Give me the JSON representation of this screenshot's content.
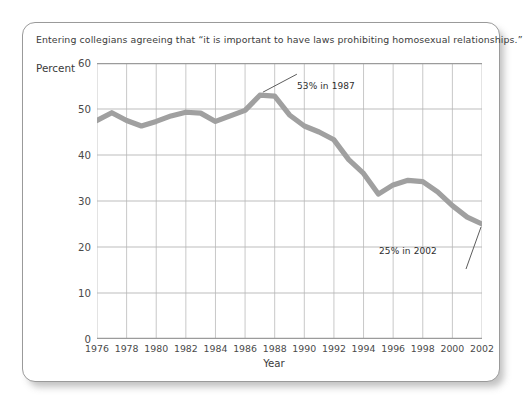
{
  "figure": {
    "title": "Entering collegians agreeing that “it is important to have laws prohibiting homosexual relationships.”",
    "percent_label": "Percent",
    "year_label": "Year"
  },
  "chart_data": {
    "type": "line",
    "title": "Entering collegians agreeing that “it is important to have laws prohibiting homosexual relationships.”",
    "xlabel": "Year",
    "ylabel": "Percent",
    "xlim": [
      1976,
      2002
    ],
    "ylim": [
      0,
      60
    ],
    "grid": true,
    "legend": "none",
    "line_color": "#a0a0a0",
    "x_tick_labels": [
      "1976",
      "1978",
      "1980",
      "1982",
      "1984",
      "1986",
      "1988",
      "1990",
      "1992",
      "1994",
      "1996",
      "1998",
      "2000",
      "2002"
    ],
    "x_tick_values": [
      1976,
      1978,
      1980,
      1982,
      1984,
      1986,
      1988,
      1990,
      1992,
      1994,
      1996,
      1998,
      2000,
      2002
    ],
    "y_tick_labels": [
      "0",
      "10",
      "20",
      "30",
      "40",
      "50",
      "60"
    ],
    "y_tick_values": [
      0,
      10,
      20,
      30,
      40,
      50,
      60
    ],
    "x": [
      1976,
      1977,
      1978,
      1979,
      1980,
      1981,
      1982,
      1983,
      1984,
      1985,
      1986,
      1987,
      1988,
      1989,
      1990,
      1991,
      1992,
      1993,
      1994,
      1995,
      1996,
      1997,
      1998,
      1999,
      2000,
      2001,
      2002
    ],
    "values": [
      47.5,
      49.2,
      47.5,
      46.3,
      47.3,
      48.5,
      49.3,
      49.1,
      47.3,
      48.5,
      49.7,
      53.0,
      52.8,
      48.7,
      46.3,
      45.0,
      43.3,
      39.0,
      36.0,
      31.5,
      33.5,
      34.5,
      34.2,
      32.0,
      29.0,
      26.5,
      25.0
    ],
    "annotations": [
      {
        "text": "53% in 1987",
        "x": 1987,
        "y": 53
      },
      {
        "text": "25% in 2002",
        "x": 2002,
        "y": 25
      }
    ]
  }
}
